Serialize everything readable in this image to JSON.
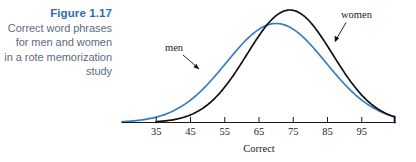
{
  "figure": {
    "label": "Figure 1.17",
    "description_lines": [
      "Correct word phrases",
      "for men and women",
      "in a rote memorization",
      "study"
    ],
    "label_color": "#2b6cb5",
    "description_color": "#5c6c80"
  },
  "chart_data": {
    "type": "line",
    "title": "Correct word phrases for men and women in a rote memorization study",
    "xlabel": "Correct",
    "ylabel": "",
    "grid": false,
    "legend": "inline-annotations",
    "xlim": [
      25,
      105
    ],
    "tick_labels": [
      "35",
      "45",
      "55",
      "65",
      "75",
      "85",
      "95"
    ],
    "tick_values": [
      35,
      45,
      55,
      65,
      75,
      85,
      95
    ],
    "series": [
      {
        "name": "men",
        "color": "#3a7cc0",
        "peak_x": 70,
        "peak_height": 0.88,
        "spread": 14.5,
        "annotation": "men"
      },
      {
        "name": "women",
        "color": "#111111",
        "peak_x": 74,
        "peak_height": 1.0,
        "spread": 12.5,
        "annotation": "women"
      }
    ],
    "annotations": [
      {
        "text": "men",
        "points_to_series": "men"
      },
      {
        "text": "women",
        "points_to_series": "women"
      }
    ]
  },
  "axis": {
    "title": "Correct"
  }
}
